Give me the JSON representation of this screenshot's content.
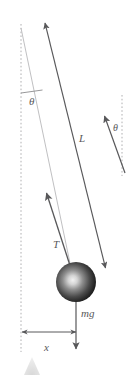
{
  "figure": {
    "width": 133,
    "height": 377,
    "background_color": "#ffffff"
  },
  "labels": {
    "angle_vertical": "θ",
    "angle_tension": "θ",
    "length": "L",
    "tension": "T",
    "weight": "mg",
    "displacement": "x"
  },
  "colors": {
    "line_dark": "#58585a",
    "line_light": "#b9b9bb",
    "dashed_axis": "#b0b0b2",
    "bob_edge": "#1c1c1c",
    "bob_highlight": "#efefef",
    "bob_core": "#3a3a3a",
    "floor_triangle": "#e2e2e2",
    "text": "#58585a"
  },
  "elements": {
    "vertical_axis_left": {
      "x": 21,
      "y1": 24,
      "y2": 352,
      "style": "dashed"
    },
    "vertical_axis_right": {
      "x": 122,
      "y1": 95,
      "y2": 176,
      "style": "dashed"
    },
    "string_line": {
      "x1": 21,
      "y1": 28,
      "x2": 75,
      "y2": 290,
      "style": "thin-light"
    },
    "length_arrow": {
      "x1": 45,
      "y1": 22,
      "x2": 106,
      "y2": 269,
      "heads": "both"
    },
    "tension_arrow": {
      "x1": 75,
      "y1": 282,
      "x2": 45,
      "y2": 190,
      "heads": "end"
    },
    "weight_arrow": {
      "x1": 76,
      "y1": 275,
      "x2": 76,
      "y2": 350,
      "heads": "end"
    },
    "angle_marker_line": {
      "x1": 21,
      "y1": 93,
      "x2": 42,
      "y2": 90
    },
    "tension_angle_arrow": {
      "x1": 125,
      "y1": 172,
      "x2": 104,
      "y2": 114,
      "heads": "end"
    },
    "displacement_arrow": {
      "x1": 21,
      "y1": 332,
      "x2": 77,
      "y2": 332,
      "heads": "both"
    },
    "bob": {
      "cx": 76,
      "cy": 282,
      "r": 20
    },
    "floor_triangle": {
      "cx": 32,
      "base_y": 375,
      "top_y": 357,
      "half_width": 8
    }
  },
  "label_positions": {
    "angle_vertical": {
      "x": 29,
      "y": 105
    },
    "angle_tension": {
      "x": 116,
      "y": 131
    },
    "length": {
      "x": 82,
      "y": 141
    },
    "tension": {
      "x": 57,
      "y": 247
    },
    "weight": {
      "x": 82,
      "y": 317
    },
    "displacement": {
      "x": 45,
      "y": 350
    }
  }
}
